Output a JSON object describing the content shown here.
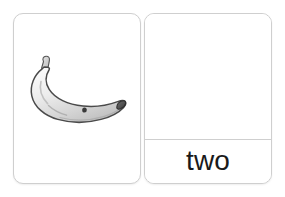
{
  "flashcards": {
    "picture_card": {
      "name": "picture-card",
      "illustration": {
        "icon_name": "banana-illustration",
        "subject": "banana",
        "style": "grayscale line drawing",
        "colors": {
          "outline": "#3a3a3a",
          "body_light": "#f2f2f2",
          "body_mid": "#d8d8d8",
          "body_shadow": "#b5b5b5",
          "stem": "#c9c9c9",
          "tip": "#4a4a4a",
          "spot": "#3a3a3a"
        }
      }
    },
    "word_card": {
      "name": "word-card",
      "blank_area_label": "",
      "word": "two"
    },
    "colors": {
      "background": "#ffffff",
      "card_background": "#ffffff",
      "card_border": "#cfcfcf",
      "divider": "#cfcfcf",
      "text": "#1a1a1a"
    }
  }
}
